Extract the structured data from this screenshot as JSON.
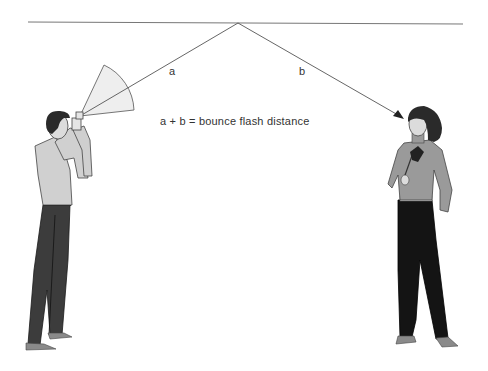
{
  "diagram": {
    "title": "Bounce flash distance",
    "labels": {
      "a": "a",
      "b": "b",
      "equation": "a + b = bounce flash distance"
    },
    "elements": {
      "ceiling": "ceiling line",
      "path_a": "flash path to ceiling",
      "path_b": "reflected path to subject",
      "flash_cone": "flash beam cone",
      "photographer": "photographer with camera",
      "subject": "woman holding a flower"
    },
    "colors": {
      "line": "#555555",
      "cone_fill": "#eeeeee",
      "shirt": "#d0d0d0",
      "trousers_man": "#3c3c3c",
      "hair": "#2a2a2a",
      "sweater": "#9a9a9a",
      "trousers_woman": "#141414",
      "shoes": "#8a8a8a",
      "skin": "#dcdcdc"
    }
  }
}
